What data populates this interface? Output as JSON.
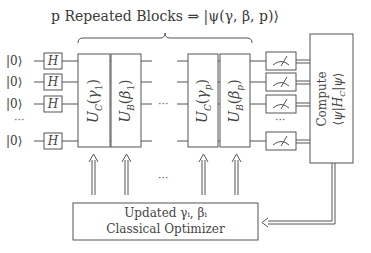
{
  "diagram": {
    "title": "p Repeated Blocks ⇒ |ψ(γ, β, p)⟩",
    "qubits": [
      {
        "init": "|0⟩",
        "gate": "H"
      },
      {
        "init": "|0⟩",
        "gate": "H"
      },
      {
        "init": "|0⟩",
        "gate": "H"
      },
      {
        "init": "|0⟩",
        "gate": "H"
      }
    ],
    "ellipsis": "···",
    "blocks": [
      {
        "label": "U_C(γ_1)",
        "display": "UC(γ1)"
      },
      {
        "label": "U_B(β_1)",
        "display": "UB(β1)"
      },
      {
        "label": "U_C(γ_p)",
        "display": "UC(γp)"
      },
      {
        "label": "U_B(β_p)",
        "display": "UB(βp)"
      }
    ],
    "measurement_icon": "meter-icon",
    "compute_box": {
      "line1": "Compute",
      "line2": "⟨ψ|H_C|ψ⟩"
    },
    "optimizer_box": {
      "line1": "Updated γᵢ, βᵢ",
      "line2": "Classical Optimizer"
    }
  }
}
